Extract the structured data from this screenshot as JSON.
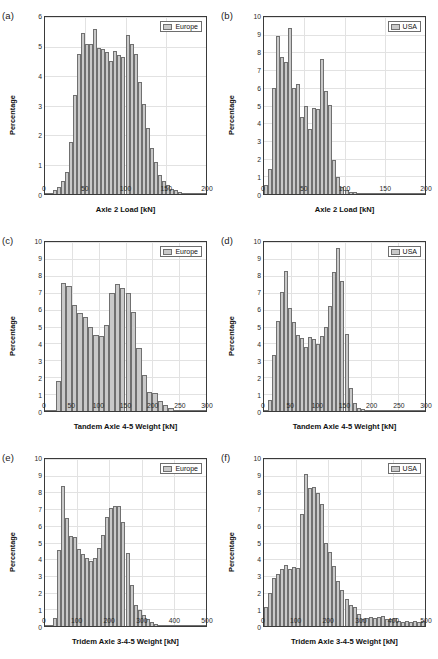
{
  "figure": {
    "width": 438,
    "height": 659,
    "bar_fill": "#c9c9c9",
    "bar_edge": "#707070",
    "grid_color": "#e2e2e2",
    "axis_color": "#3a3a3a"
  },
  "chart_data": [
    {
      "id": "a",
      "type": "bar",
      "panel_label": "(a)",
      "legend": "Europe",
      "title": "",
      "xlabel": "Axle 2 Load [kN]",
      "ylabel": "Percentage",
      "xlim": [
        0,
        200
      ],
      "ylim": [
        0,
        6
      ],
      "xticks": [
        0,
        50,
        100,
        150,
        200
      ],
      "yticks": [
        0,
        1,
        2,
        3,
        4,
        5,
        6
      ],
      "grid": true,
      "bin_width": 5,
      "bin_starts": [
        0,
        5,
        10,
        15,
        20,
        25,
        30,
        35,
        40,
        45,
        50,
        55,
        60,
        65,
        70,
        75,
        80,
        85,
        90,
        95,
        100,
        105,
        110,
        115,
        120,
        125,
        130,
        135,
        140,
        145,
        150,
        155,
        160,
        165,
        170,
        175,
        180,
        185,
        190,
        195
      ],
      "values": [
        0.02,
        0.05,
        0.12,
        0.25,
        0.45,
        0.75,
        1.75,
        3.35,
        4.75,
        5.45,
        5.1,
        5.1,
        5.6,
        4.95,
        4.9,
        4.8,
        4.5,
        4.85,
        4.7,
        4.65,
        5.4,
        5.1,
        4.75,
        3.8,
        3.05,
        2.25,
        1.55,
        1.1,
        0.65,
        0.45,
        0.3,
        0.18,
        0.12,
        0.08,
        0.05,
        0.04,
        0.03,
        0.02,
        0.02,
        0.01
      ]
    },
    {
      "id": "b",
      "type": "bar",
      "panel_label": "(b)",
      "legend": "USA",
      "title": "",
      "xlabel": "Axle 2 Load [kN]",
      "ylabel": "Percentage",
      "xlim": [
        0,
        200
      ],
      "ylim": [
        0,
        10
      ],
      "xticks": [
        0,
        50,
        100,
        150,
        200
      ],
      "yticks": [
        0,
        1,
        2,
        3,
        4,
        5,
        6,
        7,
        8,
        9,
        10
      ],
      "grid": true,
      "bin_width": 5,
      "bin_starts": [
        0,
        5,
        10,
        15,
        20,
        25,
        30,
        35,
        40,
        45,
        50,
        55,
        60,
        65,
        70,
        75,
        80,
        85,
        90,
        95,
        100,
        105,
        110,
        115,
        120,
        125,
        130,
        135,
        140,
        145,
        150,
        155,
        160,
        165,
        170,
        175,
        180,
        185,
        190,
        195
      ],
      "values": [
        0.5,
        1.4,
        6.0,
        8.95,
        7.75,
        7.45,
        9.4,
        6.0,
        6.2,
        4.35,
        4.95,
        3.65,
        4.85,
        4.8,
        7.6,
        5.8,
        5.05,
        1.9,
        0.95,
        0.4,
        0.2,
        0.12,
        0.1,
        0.08,
        0.07,
        0.06,
        0.06,
        0.05,
        0.05,
        0.05,
        0.05,
        0.04,
        0.04,
        0.04,
        0.04,
        0.03,
        0.03,
        0.03,
        0.03,
        0.03
      ]
    },
    {
      "id": "c",
      "type": "bar",
      "panel_label": "(c)",
      "legend": "Europe",
      "title": "",
      "xlabel": "Tandem Axle 4-5 Weight [kN]",
      "ylabel": "Percentage",
      "xlim": [
        0,
        300
      ],
      "ylim": [
        0,
        10
      ],
      "xticks": [
        0,
        50,
        100,
        150,
        200,
        250,
        300
      ],
      "yticks": [
        0,
        1,
        2,
        3,
        4,
        5,
        6,
        7,
        8,
        9,
        10
      ],
      "grid": true,
      "bin_width": 10,
      "bin_starts": [
        0,
        10,
        20,
        30,
        40,
        50,
        60,
        70,
        80,
        90,
        100,
        110,
        120,
        130,
        140,
        150,
        160,
        170,
        180,
        190,
        200,
        210,
        220,
        230,
        240,
        250,
        260,
        270,
        280,
        290
      ],
      "values": [
        0.02,
        0.08,
        1.8,
        7.6,
        7.4,
        6.3,
        5.8,
        5.55,
        5.0,
        4.5,
        4.45,
        5.1,
        7.0,
        7.5,
        7.25,
        7.0,
        5.85,
        3.75,
        2.15,
        1.15,
        1.05,
        0.6,
        0.35,
        0.15,
        0.08,
        0.05,
        0.04,
        0.03,
        0.02,
        0.02
      ]
    },
    {
      "id": "d",
      "type": "bar",
      "panel_label": "(d)",
      "legend": "USA",
      "title": "",
      "xlabel": "Tandem Axle 4-5 Weight [kN]",
      "ylabel": "Percentage",
      "xlim": [
        0,
        300
      ],
      "ylim": [
        0,
        10
      ],
      "xticks": [
        0,
        50,
        100,
        150,
        200,
        250,
        300
      ],
      "yticks": [
        0,
        1,
        2,
        3,
        4,
        5,
        6,
        7,
        8,
        9,
        10
      ],
      "grid": true,
      "bin_width": 7.5,
      "bin_starts": [
        0,
        7.5,
        15,
        22.5,
        30,
        37.5,
        45,
        52.5,
        60,
        67.5,
        75,
        82.5,
        90,
        97.5,
        105,
        112.5,
        120,
        127.5,
        135,
        142.5,
        150,
        157.5,
        165,
        172.5,
        180,
        187.5,
        195,
        202.5,
        210,
        217.5,
        225,
        232.5,
        240,
        247.5,
        255,
        262.5,
        270,
        277.5,
        285,
        292.5
      ],
      "values": [
        0.05,
        0.65,
        3.3,
        5.35,
        7.05,
        8.3,
        6.1,
        5.25,
        4.5,
        4.35,
        3.8,
        4.4,
        4.25,
        3.95,
        4.45,
        5.0,
        6.2,
        8.2,
        9.65,
        7.7,
        4.55,
        1.35,
        0.5,
        0.2,
        0.12,
        0.08,
        0.06,
        0.05,
        0.04,
        0.04,
        0.03,
        0.03,
        0.03,
        0.02,
        0.02,
        0.02,
        0.02,
        0.02,
        0.01,
        0.01
      ]
    },
    {
      "id": "e",
      "type": "bar",
      "panel_label": "(e)",
      "legend": "Europe",
      "title": "",
      "xlabel": "Tridem Axle 3-4-5 Weight [kN]",
      "ylabel": "Percentage",
      "xlim": [
        0,
        500
      ],
      "ylim": [
        0,
        10
      ],
      "xticks": [
        0,
        100,
        200,
        300,
        400,
        500
      ],
      "yticks": [
        0,
        1,
        2,
        3,
        4,
        5,
        6,
        7,
        8,
        9,
        10
      ],
      "grid": true,
      "bin_width": 12.5,
      "bin_starts": [
        0,
        12.5,
        25,
        37.5,
        50,
        62.5,
        75,
        87.5,
        100,
        112.5,
        125,
        137.5,
        150,
        162.5,
        175,
        187.5,
        200,
        212.5,
        225,
        237.5,
        250,
        262.5,
        275,
        287.5,
        300,
        312.5,
        325,
        337.5,
        350,
        362.5,
        375,
        387.5,
        400,
        412.5,
        425,
        437.5,
        450,
        462.5,
        475,
        487.5
      ],
      "values": [
        0.02,
        0.05,
        0.5,
        4.55,
        8.4,
        6.45,
        5.4,
        5.35,
        4.6,
        4.3,
        4.05,
        3.9,
        4.05,
        4.7,
        5.45,
        6.5,
        7.05,
        7.2,
        7.2,
        6.25,
        4.4,
        2.45,
        1.25,
        0.95,
        0.65,
        0.4,
        0.25,
        0.12,
        0.08,
        0.05,
        0.04,
        0.03,
        0.03,
        0.02,
        0.02,
        0.02,
        0.01,
        0.01,
        0.01,
        0.01
      ]
    },
    {
      "id": "f",
      "type": "bar",
      "panel_label": "(f)",
      "legend": "USA",
      "title": "",
      "xlabel": "Tridem Axle 3-4-5 Weight [kN]",
      "ylabel": "Percentage",
      "xlim": [
        0,
        500
      ],
      "ylim": [
        0,
        10
      ],
      "xticks": [
        0,
        100,
        200,
        300,
        400,
        500
      ],
      "yticks": [
        0,
        1,
        2,
        3,
        4,
        5,
        6,
        7,
        8,
        9,
        10
      ],
      "grid": true,
      "bin_width": 12.5,
      "bin_starts": [
        0,
        12.5,
        25,
        37.5,
        50,
        62.5,
        75,
        87.5,
        100,
        112.5,
        125,
        137.5,
        150,
        162.5,
        175,
        187.5,
        200,
        212.5,
        225,
        237.5,
        250,
        262.5,
        275,
        287.5,
        300,
        312.5,
        325,
        337.5,
        350,
        362.5,
        375,
        387.5,
        400,
        412.5,
        425,
        437.5,
        450,
        462.5,
        475,
        487.5
      ],
      "values": [
        1.15,
        2.0,
        2.9,
        3.1,
        3.4,
        3.65,
        3.4,
        3.55,
        3.5,
        6.7,
        9.1,
        8.25,
        8.3,
        7.95,
        7.3,
        5.0,
        4.45,
        3.6,
        2.7,
        2.15,
        1.6,
        1.25,
        1.15,
        0.7,
        0.45,
        0.5,
        0.55,
        0.5,
        0.55,
        0.6,
        0.45,
        0.4,
        0.5,
        0.3,
        0.25,
        0.3,
        0.25,
        0.3,
        0.25,
        0.3
      ]
    }
  ]
}
